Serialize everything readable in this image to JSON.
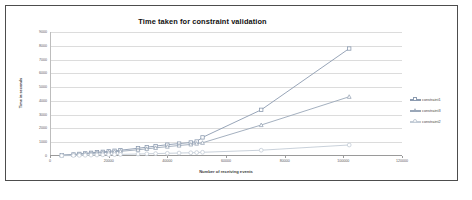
{
  "chart_data": {
    "type": "line",
    "title": "Time taken for constraint validation",
    "xlabel": "Number of  receiving events",
    "ylabel": "Time in seconds",
    "xlim": [
      0,
      120000
    ],
    "ylim": [
      0,
      9000
    ],
    "grid": true,
    "legend_position": "right",
    "xticks": [
      "0",
      "20000",
      "40000",
      "60000",
      "80000",
      "100000",
      "120000"
    ],
    "xtick_values": [
      0,
      20000,
      40000,
      60000,
      80000,
      100000,
      120000
    ],
    "yticks": [
      "0",
      "1000",
      "2000",
      "3000",
      "4000",
      "5000",
      "6000",
      "7000",
      "8000",
      "9000"
    ],
    "ytick_values": [
      0,
      1000,
      2000,
      3000,
      4000,
      5000,
      6000,
      7000,
      8000,
      9000
    ],
    "series": [
      {
        "name": "constraint1",
        "color": "#8c9bb0",
        "marker": "square",
        "x": [
          4000,
          8000,
          10000,
          12000,
          14000,
          16000,
          18000,
          20000,
          22000,
          24000,
          30000,
          33000,
          36000,
          40000,
          44000,
          48000,
          50000,
          52000,
          72000,
          102000
        ],
        "y": [
          60,
          110,
          150,
          190,
          230,
          270,
          300,
          340,
          380,
          420,
          560,
          640,
          720,
          820,
          900,
          980,
          1050,
          1350,
          3350,
          7800
        ]
      },
      {
        "name": "constraint3",
        "color": "#9aa7b8",
        "marker": "triangle",
        "x": [
          4000,
          8000,
          10000,
          12000,
          14000,
          16000,
          18000,
          20000,
          22000,
          24000,
          30000,
          33000,
          36000,
          40000,
          44000,
          48000,
          50000,
          52000,
          72000,
          102000
        ],
        "y": [
          50,
          90,
          120,
          150,
          185,
          215,
          245,
          275,
          310,
          340,
          450,
          520,
          590,
          680,
          760,
          840,
          900,
          960,
          2250,
          4300
        ]
      },
      {
        "name": "constraint2",
        "color": "#c3ccd6",
        "marker": "circle",
        "x": [
          4000,
          8000,
          10000,
          12000,
          14000,
          16000,
          18000,
          20000,
          22000,
          24000,
          30000,
          33000,
          36000,
          40000,
          44000,
          48000,
          50000,
          52000,
          72000,
          102000
        ],
        "y": [
          20,
          35,
          45,
          55,
          65,
          75,
          85,
          95,
          105,
          115,
          145,
          160,
          175,
          195,
          215,
          235,
          250,
          270,
          420,
          800
        ]
      }
    ]
  },
  "legend": {
    "items": [
      {
        "label": "constraint1"
      },
      {
        "label": "constraint3"
      },
      {
        "label": "constraint2"
      }
    ]
  }
}
